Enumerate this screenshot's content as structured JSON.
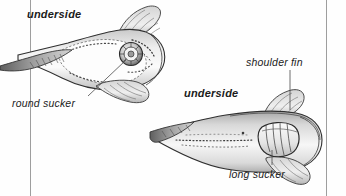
{
  "figure": {
    "background_color": "#fefefe",
    "ink_color": "#1b1b1b",
    "rule_color": "#9a9a9a",
    "labels": {
      "underside_left": "underside",
      "underside_right": "underside",
      "round_sucker": "round sucker",
      "shoulder_fin": "shoulder fin",
      "long_sucker": "long sucker"
    },
    "specimens": [
      {
        "name": "round-sucker-fish",
        "orientation": "tail-left-head-right",
        "view": "underside",
        "callouts": [
          "round sucker"
        ]
      },
      {
        "name": "long-sucker-fish",
        "orientation": "tail-left-head-right",
        "view": "underside",
        "callouts": [
          "shoulder fin",
          "long sucker"
        ]
      }
    ],
    "rules": [
      {
        "name": "left-margin-rule",
        "x": 30
      },
      {
        "name": "right-margin-rule",
        "x": 327
      }
    ]
  }
}
